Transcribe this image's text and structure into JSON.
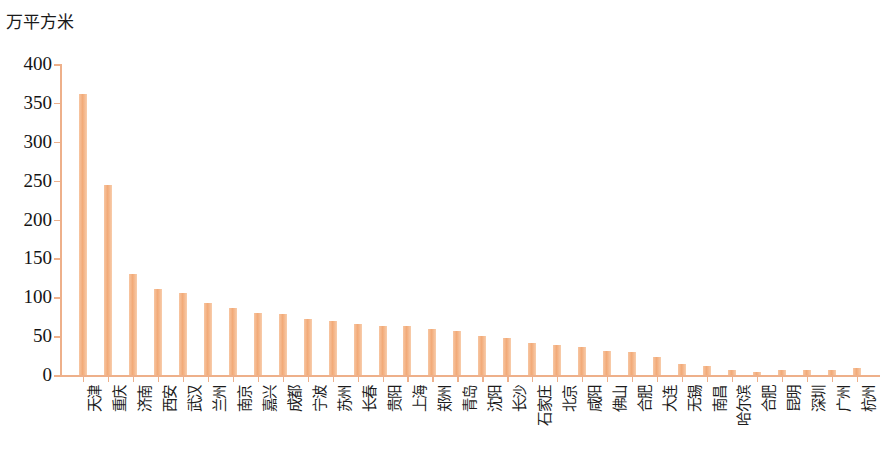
{
  "chart_data": {
    "type": "bar",
    "title": "",
    "subtitle": "",
    "xlabel": "",
    "ylabel": "万平方米",
    "ylim": [
      0,
      400
    ],
    "ytick_step": 50,
    "yticks": [
      "400",
      "350",
      "300",
      "250",
      "200",
      "150",
      "100",
      "50",
      "0"
    ],
    "grid": false,
    "legend": null,
    "bar_color": "#f4b384",
    "axis_color": "#eeb08a",
    "categories": [
      "天津",
      "重庆",
      "济南",
      "西安",
      "武汉",
      "兰州",
      "南京",
      "嘉兴",
      "成都",
      "宁波",
      "苏州",
      "长春",
      "贵阳",
      "上海",
      "郑州",
      "青岛",
      "沈阳",
      "长沙",
      "石家庄",
      "北京",
      "咸阳",
      "佛山",
      "合肥",
      "大连",
      "无锡",
      "南昌",
      "哈尔滨",
      "合肥",
      "昆明",
      "深圳",
      "广州",
      "杭州"
    ],
    "values": [
      362,
      245,
      130,
      111,
      105,
      93,
      86,
      80,
      78,
      72,
      70,
      65,
      63,
      63,
      59,
      57,
      50,
      47,
      41,
      38,
      36,
      31,
      29,
      23,
      14,
      12,
      6,
      4,
      6,
      6,
      7,
      9
    ]
  }
}
